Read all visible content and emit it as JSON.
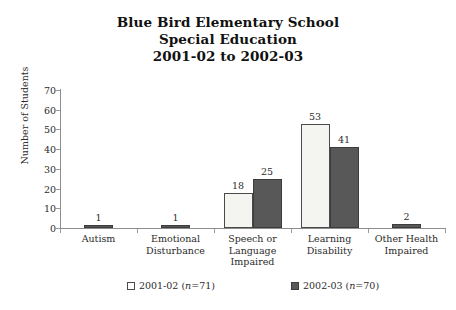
{
  "chart_data": {
    "type": "bar",
    "title": "Blue Bird Elementary School Special Education 2001-02 to 2002-03",
    "title_lines": [
      "Blue Bird Elementary School",
      "Special Education",
      "2001-02 to 2002-03"
    ],
    "xlabel": "",
    "ylabel": "Number of Students",
    "ylim": [
      0,
      70
    ],
    "ytick_step": 10,
    "yticks": [
      0,
      10,
      20,
      30,
      40,
      50,
      60,
      70
    ],
    "grid": false,
    "legend_position": "bottom",
    "categories": [
      "Autism",
      "Emotional Disturbance",
      "Speech or Language Impaired",
      "Learning Disability",
      "Other Health Impaired"
    ],
    "category_lines": [
      [
        "Autism"
      ],
      [
        "Emotional",
        "Disturbance"
      ],
      [
        "Speech or",
        "Language",
        "Impaired"
      ],
      [
        "Learning",
        "Disability"
      ],
      [
        "Other Health",
        "Impaired"
      ]
    ],
    "series": [
      {
        "name": "2001-02 (n=71)",
        "color": "#f4f4f1",
        "values": [
          null,
          null,
          18,
          53,
          null
        ],
        "labels": [
          "",
          "",
          "18",
          "53",
          ""
        ]
      },
      {
        "name": "2002-03 (n=70)",
        "color": "#585858",
        "values": [
          1,
          1,
          25,
          41,
          2
        ],
        "labels": [
          "1",
          "1",
          "25",
          "41",
          "2"
        ]
      }
    ]
  },
  "legend": {
    "items": [
      {
        "label_prefix": "2001-02 (",
        "label_italic": "n",
        "label_suffix": "=71)",
        "swatch": "open-square"
      },
      {
        "label_prefix": "2002-03 (",
        "label_italic": "n",
        "label_suffix": "=70)",
        "swatch": "filled-square"
      }
    ]
  }
}
